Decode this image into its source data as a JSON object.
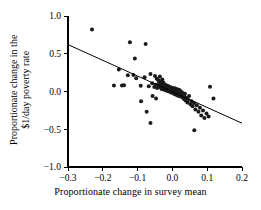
{
  "chart_data": {
    "type": "scatter",
    "title": "",
    "subtitle": "",
    "xlabel": "Proportionate change in survey mean",
    "ylabel_line1": "Proportionate change in the",
    "ylabel_line2": "$1/day poverty rate",
    "xlim": [
      -0.3,
      0.2
    ],
    "ylim": [
      -1.0,
      1.0
    ],
    "xticks": [
      -0.3,
      -0.2,
      -0.1,
      0.0,
      0.1,
      0.2
    ],
    "xticklabels": [
      "−0.3",
      "−0.2",
      "−0.1",
      "0.0",
      "0.1",
      "0.2"
    ],
    "yticks": [
      -1.0,
      -0.5,
      0.0,
      0.5,
      1.0
    ],
    "yticklabels": [
      "−1.0",
      "−0.5",
      "0.0",
      "0.5",
      "1.0"
    ],
    "grid": false,
    "legend": null,
    "marker": "filled-circle",
    "marker_color": "#1a1a1a",
    "marker_size": 2.0,
    "fit_line": {
      "label": "regression line",
      "color": "#000000",
      "slope": -2.08,
      "intercept": -0.004,
      "x_start": -0.3,
      "y_start": 0.621,
      "x_end": 0.2,
      "y_end": -0.42
    },
    "series": [
      {
        "name": "countries",
        "n_points": 141,
        "points": [
          [
            -0.231,
            0.82
          ],
          [
            -0.122,
            0.652
          ],
          [
            -0.077,
            0.63
          ],
          [
            -0.108,
            0.438
          ],
          [
            -0.154,
            0.292
          ],
          [
            -0.128,
            0.215
          ],
          [
            -0.112,
            0.22
          ],
          [
            -0.104,
            0.176
          ],
          [
            -0.08,
            0.188
          ],
          [
            -0.063,
            0.232
          ],
          [
            -0.05,
            0.205
          ],
          [
            -0.045,
            0.168
          ],
          [
            -0.04,
            0.15
          ],
          [
            -0.036,
            0.198
          ],
          [
            -0.034,
            0.134
          ],
          [
            -0.029,
            0.16
          ],
          [
            -0.026,
            0.118
          ],
          [
            -0.168,
            0.078
          ],
          [
            -0.145,
            0.08
          ],
          [
            -0.139,
            0.082
          ],
          [
            -0.091,
            0.075
          ],
          [
            -0.068,
            0.068
          ],
          [
            -0.058,
            0.108
          ],
          [
            -0.052,
            0.06
          ],
          [
            -0.048,
            0.088
          ],
          [
            -0.044,
            0.045
          ],
          [
            -0.041,
            0.1
          ],
          [
            -0.038,
            0.072
          ],
          [
            -0.035,
            0.052
          ],
          [
            -0.033,
            0.094
          ],
          [
            -0.031,
            0.064
          ],
          [
            -0.03,
            0.03
          ],
          [
            -0.028,
            0.086
          ],
          [
            -0.026,
            0.048
          ],
          [
            -0.025,
            0.074
          ],
          [
            -0.023,
            0.022
          ],
          [
            -0.022,
            0.058
          ],
          [
            -0.021,
            0.09
          ],
          [
            -0.02,
            0.038
          ],
          [
            -0.019,
            0.066
          ],
          [
            -0.018,
            0.014
          ],
          [
            -0.017,
            0.046
          ],
          [
            -0.016,
            0.078
          ],
          [
            -0.015,
            0.026
          ],
          [
            -0.014,
            0.056
          ],
          [
            -0.013,
            0.008
          ],
          [
            -0.012,
            0.04
          ],
          [
            -0.012,
            0.07
          ],
          [
            -0.011,
            0.018
          ],
          [
            -0.01,
            0.05
          ],
          [
            -0.01,
            0.002
          ],
          [
            -0.009,
            0.032
          ],
          [
            -0.008,
            0.062
          ],
          [
            -0.008,
            0.012
          ],
          [
            -0.007,
            0.042
          ],
          [
            -0.006,
            -0.006
          ],
          [
            -0.006,
            0.024
          ],
          [
            -0.005,
            0.054
          ],
          [
            -0.005,
            0.004
          ],
          [
            -0.004,
            0.034
          ],
          [
            -0.004,
            -0.014
          ],
          [
            -0.003,
            0.016
          ],
          [
            -0.003,
            0.046
          ],
          [
            -0.002,
            -0.004
          ],
          [
            -0.002,
            0.026
          ],
          [
            -0.001,
            0.006
          ],
          [
            -0.001,
            0.036
          ],
          [
            0.0,
            -0.012
          ],
          [
            0.0,
            0.018
          ],
          [
            0.0,
            0.048
          ],
          [
            0.001,
            -0.002
          ],
          [
            0.001,
            0.028
          ],
          [
            0.002,
            -0.02
          ],
          [
            0.002,
            0.01
          ],
          [
            0.003,
            0.04
          ],
          [
            0.003,
            -0.01
          ],
          [
            0.004,
            0.02
          ],
          [
            0.004,
            -0.028
          ],
          [
            0.005,
            0.002
          ],
          [
            0.005,
            0.032
          ],
          [
            0.006,
            -0.018
          ],
          [
            0.006,
            0.012
          ],
          [
            0.007,
            -0.036
          ],
          [
            0.007,
            0.042
          ],
          [
            0.008,
            -0.008
          ],
          [
            0.008,
            0.022
          ],
          [
            0.009,
            -0.026
          ],
          [
            0.009,
            0.004
          ],
          [
            0.01,
            0.034
          ],
          [
            0.01,
            -0.016
          ],
          [
            0.011,
            0.014
          ],
          [
            0.011,
            -0.044
          ],
          [
            0.012,
            -0.006
          ],
          [
            0.012,
            0.026
          ],
          [
            0.013,
            -0.034
          ],
          [
            0.013,
            0.006
          ],
          [
            0.014,
            -0.022
          ],
          [
            0.014,
            0.018
          ],
          [
            0.015,
            -0.052
          ],
          [
            0.015,
            -0.012
          ],
          [
            0.016,
            0.028
          ],
          [
            0.016,
            -0.042
          ],
          [
            0.017,
            -0.002
          ],
          [
            0.018,
            -0.03
          ],
          [
            0.018,
            0.01
          ],
          [
            0.019,
            -0.06
          ],
          [
            0.02,
            -0.02
          ],
          [
            0.02,
            0.02
          ],
          [
            0.021,
            -0.048
          ],
          [
            0.022,
            -0.008
          ],
          [
            0.023,
            -0.038
          ],
          [
            0.024,
            0.002
          ],
          [
            0.025,
            -0.068
          ],
          [
            0.026,
            -0.026
          ],
          [
            0.027,
            -0.056
          ],
          [
            0.028,
            -0.014
          ],
          [
            0.03,
            -0.078
          ],
          [
            0.031,
            -0.044
          ],
          [
            0.033,
            -0.1
          ],
          [
            0.034,
            -0.064
          ],
          [
            0.036,
            -0.03
          ],
          [
            0.038,
            -0.118
          ],
          [
            0.04,
            -0.084
          ],
          [
            0.043,
            -0.146
          ],
          [
            0.045,
            -0.108
          ],
          [
            0.048,
            -0.06
          ],
          [
            0.052,
            -0.17
          ],
          [
            0.055,
            -0.128
          ],
          [
            0.058,
            -0.196
          ],
          [
            0.062,
            -0.152
          ],
          [
            0.066,
            -0.238
          ],
          [
            0.063,
            -0.512
          ],
          [
            0.07,
            -0.182
          ],
          [
            0.075,
            -0.268
          ],
          [
            0.079,
            -0.215
          ],
          [
            0.083,
            -0.318
          ],
          [
            0.088,
            -0.252
          ],
          [
            0.092,
            -0.35
          ],
          [
            0.098,
            -0.29
          ],
          [
            0.104,
            -0.33
          ],
          [
            0.108,
            0.062
          ],
          [
            0.118,
            -0.092
          ],
          [
            -0.074,
            -0.268
          ],
          [
            -0.063,
            -0.418
          ],
          [
            -0.09,
            -0.128
          ],
          [
            -0.057,
            -0.06
          ],
          [
            -0.047,
            -0.092
          ]
        ]
      }
    ]
  }
}
